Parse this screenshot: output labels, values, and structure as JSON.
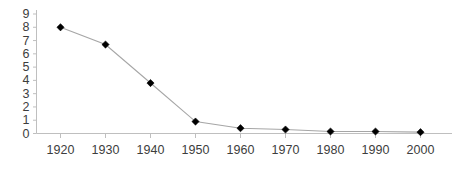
{
  "chart_data": {
    "type": "line",
    "title": "",
    "subtitle": "",
    "xlabel": "",
    "ylabel": "",
    "x": [
      1920,
      1930,
      1940,
      1950,
      1960,
      1970,
      1980,
      1990,
      2000
    ],
    "categories": [
      "1920",
      "1930",
      "1940",
      "1950",
      "1960",
      "1970",
      "1980",
      "1990",
      "2000"
    ],
    "values": [
      8.0,
      6.7,
      3.8,
      0.9,
      0.4,
      0.3,
      0.15,
      0.15,
      0.1
    ],
    "series": [
      {
        "name": "",
        "values": [
          8.0,
          6.7,
          3.8,
          0.9,
          0.4,
          0.3,
          0.15,
          0.15,
          0.1
        ]
      }
    ],
    "xlim": [
      1915,
      2005
    ],
    "ylim": [
      0,
      9
    ],
    "ytick_labels": [
      "0",
      "1",
      "2",
      "3",
      "4",
      "5",
      "6",
      "7",
      "8",
      "9"
    ],
    "ytick_values": [
      0,
      1,
      2,
      3,
      4,
      5,
      6,
      7,
      8,
      9
    ],
    "xtick_labels": [
      "1920",
      "1930",
      "1940",
      "1950",
      "1960",
      "1970",
      "1980",
      "1990",
      "2000"
    ],
    "xtick_values": [
      1920,
      1930,
      1940,
      1950,
      1960,
      1970,
      1980,
      1990,
      2000
    ],
    "grid": false,
    "legend": false,
    "legend_position": "none",
    "marker": "diamond",
    "marker_color": "#000000",
    "line_color": "#a6a6a6",
    "axis_color": "#bfbfbf",
    "tick_label_color": "#3d3d3d",
    "background_color": "#ffffff",
    "annotations": []
  }
}
